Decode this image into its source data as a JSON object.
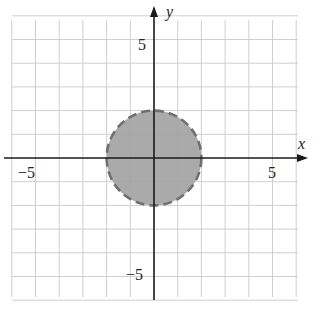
{
  "chart_data": {
    "type": "region",
    "title": "",
    "xlabel": "x",
    "ylabel": "y",
    "xlim": [
      -6,
      6
    ],
    "ylim": [
      -6,
      6
    ],
    "grid": true,
    "grid_step": 1,
    "x_tick_labels": [
      {
        "value": -5,
        "label": "−5"
      },
      {
        "value": 5,
        "label": "5"
      }
    ],
    "y_tick_labels": [
      {
        "value": 5,
        "label": "5"
      },
      {
        "value": -5,
        "label": "−5"
      }
    ],
    "shapes": [
      {
        "kind": "circle",
        "center": [
          0,
          0
        ],
        "radius": 2,
        "fill": "#a3a3a3",
        "stroke": "#707070",
        "stroke_style": "dashed",
        "inequality": "x^2 + y^2 < 4"
      }
    ],
    "legend": null
  },
  "labels": {
    "x_axis": "x",
    "y_axis": "y",
    "x_neg5": "−5",
    "x_pos5": "5",
    "y_pos5": "5",
    "y_neg5": "−5"
  },
  "colors": {
    "grid": "#cfcfcf",
    "axis": "#1a1a1a",
    "region_fill": "#a3a3a3",
    "region_stroke": "#707070"
  }
}
